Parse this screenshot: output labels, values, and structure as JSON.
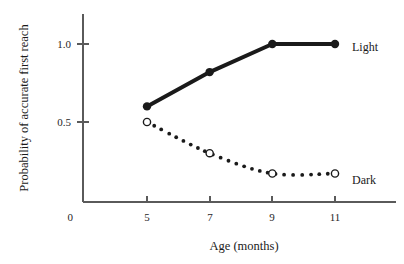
{
  "chart_data": {
    "type": "line",
    "title": "",
    "xlabel": "Age (months)",
    "ylabel": "Probability of accurate first reach",
    "x": [
      5,
      7,
      9,
      11
    ],
    "xtick_labels": [
      "5",
      "7",
      "9",
      "11"
    ],
    "ytick_labels": [
      "0",
      "0.5",
      "1.0"
    ],
    "ytick_values": [
      0,
      0.5,
      1.0
    ],
    "xlim": [
      4,
      12
    ],
    "ylim": [
      0,
      1.15
    ],
    "grid": false,
    "legend_position": "right-inline",
    "series": [
      {
        "name": "Light",
        "label": "Light",
        "values": [
          0.6,
          0.82,
          1.0,
          1.0
        ],
        "line_style": "solid",
        "marker": "filled-circle",
        "color": "#1a1a1a"
      },
      {
        "name": "Dark",
        "label": "Dark",
        "values": [
          0.5,
          0.3,
          0.17,
          0.17
        ],
        "line_style": "dotted",
        "marker": "open-circle",
        "color": "#1a1a1a"
      }
    ]
  }
}
